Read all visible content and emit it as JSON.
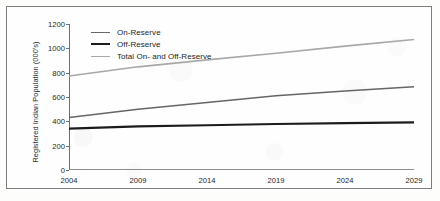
{
  "chart_data": {
    "type": "line",
    "title": "",
    "xlabel": "",
    "ylabel": "Registered Indian Population (000's)",
    "x": [
      2004,
      2009,
      2014,
      2019,
      2024,
      2029
    ],
    "xtick_labels": [
      "2004",
      "2009",
      "2014",
      "2019",
      "2024",
      "2029"
    ],
    "ytick_labels": [
      "0",
      "200",
      "400",
      "600",
      "800",
      "1000",
      "1200"
    ],
    "ytick_values": [
      0,
      200,
      400,
      600,
      800,
      1000,
      1200
    ],
    "xlim": [
      2004,
      2029
    ],
    "ylim": [
      0,
      1200
    ],
    "grid": false,
    "legend_position": "top-left-inside",
    "series": [
      {
        "name": "On-Reserve",
        "values": [
          432,
          500,
          555,
          610,
          650,
          684
        ],
        "color": "#666666",
        "width": 1.5
      },
      {
        "name": "Off-Reserve",
        "values": [
          340,
          358,
          368,
          378,
          386,
          391
        ],
        "color": "#1c1c1c",
        "width": 2.2
      },
      {
        "name": "Total On- and Off-Reserve",
        "values": [
          772,
          848,
          905,
          960,
          1018,
          1072
        ],
        "color": "#a8a8a8",
        "width": 1.6
      }
    ]
  },
  "legend": {
    "items": [
      {
        "label": "On-Reserve",
        "color": "#666666",
        "thickness": "1.5px"
      },
      {
        "label": "Off-Reserve",
        "color": "#1c1c1c",
        "thickness": "2.4px"
      },
      {
        "label": "Total On- and Off-Reserve",
        "color": "#a8a8a8",
        "thickness": "1.6px"
      }
    ]
  },
  "colors": {
    "frame_border": "#7e7e7e",
    "axis": "#6f6f6f",
    "text": "#262626",
    "background": "#fefefe"
  }
}
